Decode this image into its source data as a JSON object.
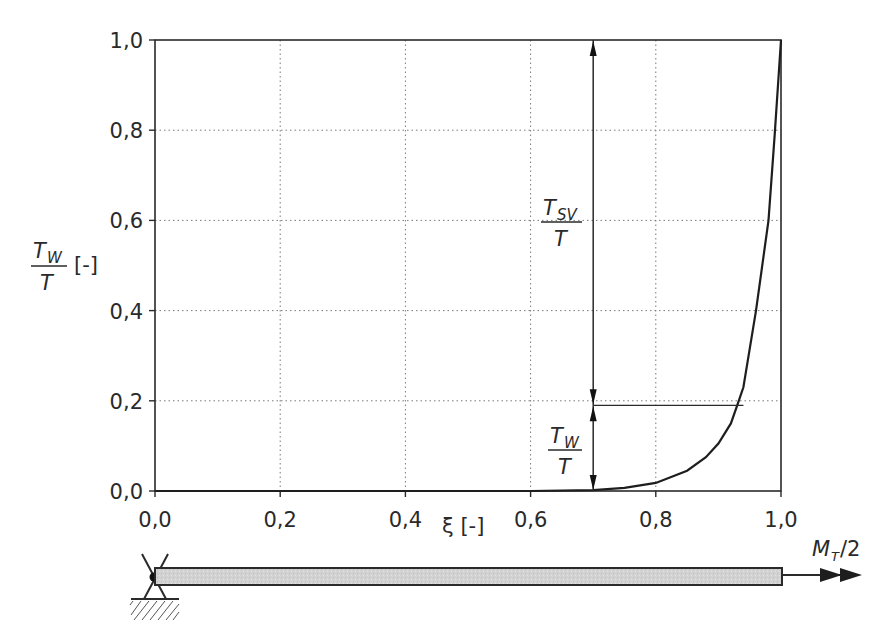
{
  "chart_data": {
    "type": "line",
    "title": "",
    "xlabel": "ξ [-]",
    "ylabel": "T_W / T [-]",
    "xlim": [
      0.0,
      1.0
    ],
    "ylim": [
      0.0,
      1.0
    ],
    "grid": true,
    "x_ticks": [
      "0,0",
      "0,2",
      "0,4",
      "0,6",
      "0,8",
      "1,0"
    ],
    "y_ticks": [
      "0,0",
      "0,2",
      "0,4",
      "0,6",
      "0,8",
      "1,0"
    ],
    "series": [
      {
        "name": "T_W/T",
        "x": [
          0.0,
          0.2,
          0.4,
          0.6,
          0.7,
          0.75,
          0.8,
          0.85,
          0.88,
          0.9,
          0.92,
          0.93,
          0.94,
          0.96,
          0.98,
          0.99,
          1.0
        ],
        "y": [
          0.0,
          0.0,
          0.0,
          0.0,
          0.002,
          0.007,
          0.018,
          0.045,
          0.075,
          0.105,
          0.15,
          0.19,
          0.23,
          0.4,
          0.6,
          0.79,
          1.0
        ]
      }
    ],
    "annotations": [
      {
        "type": "dimension-arrow",
        "x": 0.7,
        "from": 0.19,
        "to": 1.0,
        "label_main": "T",
        "label_sub": "SV",
        "label_den": "T"
      },
      {
        "type": "dimension-arrow",
        "x": 0.7,
        "from": 0.0,
        "to": 0.19,
        "label_main": "T",
        "label_sub": "W",
        "label_den": "T"
      },
      {
        "type": "hline",
        "y": 0.19,
        "x_from": 0.7,
        "x_to": 0.94
      }
    ]
  },
  "labels": {
    "y_axis_main": "T",
    "y_axis_sub": "W",
    "y_axis_den": "T",
    "y_axis_unit": "[-]",
    "x_axis": "ξ [-]",
    "tsv_main": "T",
    "tsv_sub": "SV",
    "tsv_den": "T",
    "tw_main": "T",
    "tw_sub": "W",
    "tw_den": "T",
    "moment_main": "M",
    "moment_sub": "T",
    "moment_rest": "/2"
  },
  "colors": {
    "axis": "#2a2a2a",
    "grid": "#7a7a7a",
    "curve": "#1e1e1e",
    "beam_fill": "#cfcfcf"
  }
}
